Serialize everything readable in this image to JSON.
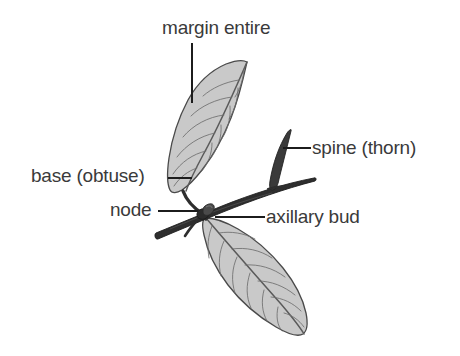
{
  "figure": {
    "title_text": "",
    "background_color": "#ffffff"
  },
  "labels": {
    "margin_entire": "margin entire",
    "spine_thorn": "spine (thorn)",
    "base_obtuse": "base (obtuse)",
    "node": "node",
    "axillary_bud": "axillary bud"
  },
  "colors": {
    "leaf_fill": "#c9c9c9",
    "leaf_outline": "#4a4a4a",
    "vein": "#6e6e6e",
    "stem": "#2e2e2e",
    "text": "#3a3a3a",
    "leader_line": "#1c1c1c"
  },
  "parts": [
    {
      "name": "upper-leaf",
      "description": "ovate leaf with acuminate apex, pinnate venation, pointing up-right"
    },
    {
      "name": "lower-leaf",
      "description": "ovate leaf with acuminate apex, pinnate venation, pointing down-right"
    },
    {
      "name": "stem",
      "description": "woody stem running lower-left to upper-right through the node"
    },
    {
      "name": "spine",
      "description": "tapered thorn projecting upward from the stem right of the node"
    },
    {
      "name": "axillary-bud",
      "description": "small bud in the axil above the node"
    },
    {
      "name": "node",
      "description": "junction where petioles and stem meet"
    }
  ]
}
